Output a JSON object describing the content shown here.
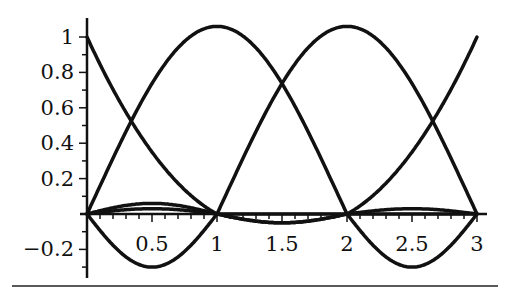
{
  "chart_data": {
    "type": "line",
    "title": "",
    "xlabel": "",
    "ylabel": "",
    "xlim": [
      0,
      3
    ],
    "ylim": [
      -0.3,
      1.1
    ],
    "grid": false,
    "legend": null,
    "x_ticks": [
      "0.5",
      "1",
      "1.5",
      "2",
      "2.5",
      "3"
    ],
    "y_ticks": [
      "-0.2",
      "0.2",
      "0.4",
      "0.6",
      "0.8",
      "1"
    ],
    "series": [
      {
        "name": "curve-1",
        "x": [
          0,
          0.25,
          0.5,
          0.75,
          1,
          1.5,
          2,
          2.5,
          3
        ],
        "values": [
          1.0,
          0.63,
          0.33,
          0.13,
          0.0,
          -0.05,
          0.0,
          0.03,
          0.0
        ]
      },
      {
        "name": "curve-2",
        "x": [
          0,
          0.25,
          0.5,
          0.8,
          1,
          1.5,
          2,
          2.5,
          3
        ],
        "values": [
          0.0,
          0.63,
          0.95,
          1.05,
          0.95,
          0.56,
          0.0,
          -0.28,
          0.0
        ]
      },
      {
        "name": "curve-3",
        "x": [
          0,
          0.5,
          1,
          1.5,
          2,
          2.2,
          2.5,
          2.75,
          3
        ],
        "values": [
          0.0,
          -0.28,
          0.0,
          0.56,
          0.95,
          1.05,
          0.95,
          0.63,
          0.0
        ]
      },
      {
        "name": "curve-4",
        "x": [
          0,
          0.5,
          1,
          1.5,
          2,
          2.25,
          2.5,
          2.75,
          3
        ],
        "values": [
          0.0,
          0.03,
          0.0,
          -0.05,
          0.0,
          0.13,
          0.33,
          0.63,
          1.0
        ]
      }
    ]
  }
}
